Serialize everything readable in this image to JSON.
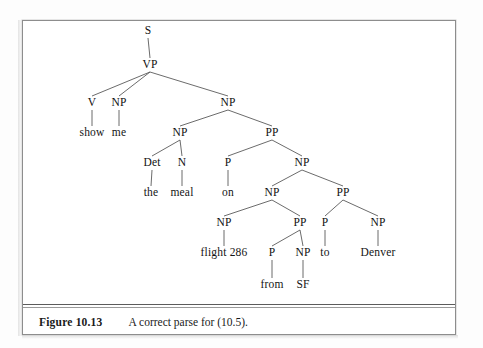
{
  "figure": {
    "caption_label": "Figure 10.13",
    "caption_text": "A correct parse for (10.5).",
    "frame_color": "#8d8d8d",
    "rule_color": "#5c5c5c",
    "text_color": "#101010",
    "edge_color": "#5a5a5a",
    "background": "#ffffff"
  },
  "tree": {
    "type": "constituency-parse-tree",
    "sentence": "show me the meal on flight 286 from SF to Denver",
    "nodes": [
      {
        "id": "s",
        "label": "S",
        "x": 148,
        "y": 31,
        "kind": "nonterminal"
      },
      {
        "id": "vp",
        "label": "VP",
        "x": 150,
        "y": 65,
        "kind": "nonterminal"
      },
      {
        "id": "v",
        "label": "V",
        "x": 92,
        "y": 103,
        "kind": "nonterminal"
      },
      {
        "id": "np_me",
        "label": "NP",
        "x": 119,
        "y": 103,
        "kind": "nonterminal"
      },
      {
        "id": "np_obj",
        "label": "NP",
        "x": 228,
        "y": 103,
        "kind": "nonterminal"
      },
      {
        "id": "show",
        "label": "show",
        "x": 92,
        "y": 133,
        "kind": "terminal"
      },
      {
        "id": "me",
        "label": "me",
        "x": 119,
        "y": 133,
        "kind": "terminal"
      },
      {
        "id": "np_meal",
        "label": "NP",
        "x": 180,
        "y": 133,
        "kind": "nonterminal"
      },
      {
        "id": "pp_on",
        "label": "PP",
        "x": 272,
        "y": 133,
        "kind": "nonterminal"
      },
      {
        "id": "det",
        "label": "Det",
        "x": 152,
        "y": 163,
        "kind": "nonterminal"
      },
      {
        "id": "n_meal",
        "label": "N",
        "x": 182,
        "y": 163,
        "kind": "nonterminal"
      },
      {
        "id": "p_on",
        "label": "P",
        "x": 228,
        "y": 163,
        "kind": "nonterminal"
      },
      {
        "id": "np_flt",
        "label": "NP",
        "x": 302,
        "y": 163,
        "kind": "nonterminal"
      },
      {
        "id": "the",
        "label": "the",
        "x": 151,
        "y": 193,
        "kind": "terminal"
      },
      {
        "id": "meal",
        "label": "meal",
        "x": 182,
        "y": 193,
        "kind": "terminal"
      },
      {
        "id": "on",
        "label": "on",
        "x": 228,
        "y": 193,
        "kind": "terminal"
      },
      {
        "id": "np_f286",
        "label": "NP",
        "x": 272,
        "y": 193,
        "kind": "nonterminal"
      },
      {
        "id": "pp_to",
        "label": "PP",
        "x": 343,
        "y": 193,
        "kind": "nonterminal"
      },
      {
        "id": "np_flight",
        "label": "NP",
        "x": 224,
        "y": 223,
        "kind": "nonterminal"
      },
      {
        "id": "pp_from",
        "label": "PP",
        "x": 300,
        "y": 223,
        "kind": "nonterminal"
      },
      {
        "id": "p_to",
        "label": "P",
        "x": 325,
        "y": 223,
        "kind": "nonterminal"
      },
      {
        "id": "np_denver",
        "label": "NP",
        "x": 378,
        "y": 223,
        "kind": "nonterminal"
      },
      {
        "id": "flight286",
        "label": "flight 286",
        "x": 224,
        "y": 253,
        "kind": "terminal"
      },
      {
        "id": "p_from",
        "label": "P",
        "x": 272,
        "y": 253,
        "kind": "nonterminal"
      },
      {
        "id": "np_sf",
        "label": "NP",
        "x": 303,
        "y": 253,
        "kind": "nonterminal"
      },
      {
        "id": "to",
        "label": "to",
        "x": 325,
        "y": 253,
        "kind": "terminal"
      },
      {
        "id": "denver",
        "label": "Denver",
        "x": 378,
        "y": 253,
        "kind": "terminal"
      },
      {
        "id": "from",
        "label": "from",
        "x": 272,
        "y": 285,
        "kind": "terminal"
      },
      {
        "id": "sf",
        "label": "SF",
        "x": 303,
        "y": 285,
        "kind": "terminal"
      }
    ],
    "edges": [
      [
        "s",
        "vp"
      ],
      [
        "vp",
        "v"
      ],
      [
        "vp",
        "np_me"
      ],
      [
        "vp",
        "np_obj"
      ],
      [
        "v",
        "show"
      ],
      [
        "np_me",
        "me"
      ],
      [
        "np_obj",
        "np_meal"
      ],
      [
        "np_obj",
        "pp_on"
      ],
      [
        "np_meal",
        "det"
      ],
      [
        "np_meal",
        "n_meal"
      ],
      [
        "pp_on",
        "p_on"
      ],
      [
        "pp_on",
        "np_flt"
      ],
      [
        "det",
        "the"
      ],
      [
        "n_meal",
        "meal"
      ],
      [
        "p_on",
        "on"
      ],
      [
        "np_flt",
        "np_f286"
      ],
      [
        "np_flt",
        "pp_to"
      ],
      [
        "np_f286",
        "np_flight"
      ],
      [
        "np_f286",
        "pp_from"
      ],
      [
        "pp_to",
        "p_to"
      ],
      [
        "pp_to",
        "np_denver"
      ],
      [
        "np_flight",
        "flight286"
      ],
      [
        "pp_from",
        "p_from"
      ],
      [
        "pp_from",
        "np_sf"
      ],
      [
        "p_to",
        "to"
      ],
      [
        "np_denver",
        "denver"
      ],
      [
        "p_from",
        "from"
      ],
      [
        "np_sf",
        "sf"
      ]
    ]
  }
}
